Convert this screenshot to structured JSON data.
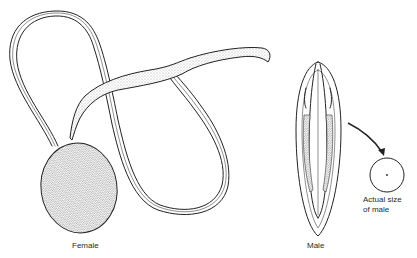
{
  "figure": {
    "subjects": [
      {
        "id": "female",
        "label": "Female"
      },
      {
        "id": "male",
        "label": "Male"
      }
    ],
    "annotation": {
      "line1": "Actual size",
      "line2": "of male"
    }
  }
}
